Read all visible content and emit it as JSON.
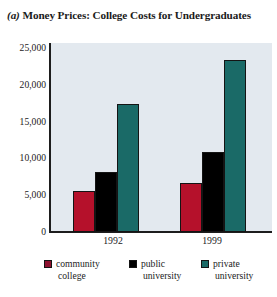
{
  "chart_data": {
    "type": "bar",
    "title": "(a) Money Prices: College Costs for Undergraduates",
    "title_prefix": "(a)",
    "title_rest": " Money Prices: College Costs for Undergraduates",
    "xlabel": "",
    "ylabel": "",
    "categories": [
      "1992",
      "1999"
    ],
    "series": [
      {
        "name": "community college",
        "values": [
          5400,
          6500
        ],
        "color": "#b5112b"
      },
      {
        "name": "public university",
        "values": [
          8000,
          10600
        ],
        "color": "#000000"
      },
      {
        "name": "private university",
        "values": [
          16900,
          22800
        ],
        "color": "#1a6a67"
      }
    ],
    "ylim": [
      0,
      25000
    ],
    "yticks": [
      0,
      5000,
      10000,
      15000,
      20000,
      25000
    ],
    "ytick_labels": [
      "0",
      "5,000",
      "10,000",
      "15,000",
      "20,000",
      "25,000"
    ],
    "grid": false,
    "legend_position": "bottom",
    "plot_background": "#e3e9ef",
    "axis_color": "#1d1d1d"
  },
  "legend": {
    "items": [
      {
        "label_line1": "community",
        "label_line2": "college",
        "color": "#8e1230"
      },
      {
        "label_line1": "public",
        "label_line2": "university",
        "color": "#000000"
      },
      {
        "label_line1": "private",
        "label_line2": "university",
        "color": "#1a6a67"
      }
    ]
  }
}
